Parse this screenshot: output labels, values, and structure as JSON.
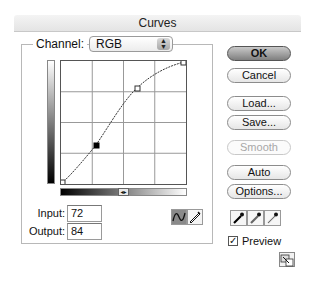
{
  "window": {
    "title": "Curves"
  },
  "channel": {
    "label": "Channel:",
    "value": "RGB",
    "stepper_glyph": "▲▼"
  },
  "graph": {
    "grid_divisions": 4,
    "curve_points": [
      {
        "input": 0,
        "output": 0,
        "selected": false
      },
      {
        "input": 72,
        "output": 84,
        "selected": true
      },
      {
        "input": 155,
        "output": 196,
        "selected": false
      },
      {
        "input": 255,
        "output": 255,
        "selected": false
      }
    ],
    "gradient_toggle_glyph": "◂▸"
  },
  "fields": {
    "input_label": "Input:",
    "input_value": "72",
    "output_label": "Output:",
    "output_value": "84"
  },
  "tools": {
    "curve_tool": {
      "icon": "curve-icon",
      "active": true
    },
    "pencil_tool": {
      "icon": "pencil-icon",
      "active": false
    }
  },
  "buttons": {
    "ok": "OK",
    "cancel": "Cancel",
    "load": "Load...",
    "save": "Save...",
    "smooth": "Smooth",
    "auto": "Auto",
    "options": "Options..."
  },
  "eyedroppers": [
    {
      "name": "black-point-eyedropper",
      "icon": "eyedropper-icon"
    },
    {
      "name": "gray-point-eyedropper",
      "icon": "eyedropper-icon"
    },
    {
      "name": "white-point-eyedropper",
      "icon": "eyedropper-icon"
    }
  ],
  "preview": {
    "label": "Preview",
    "checked": true,
    "check_glyph": "✓"
  },
  "expand": {
    "icon": "expand-icon"
  }
}
